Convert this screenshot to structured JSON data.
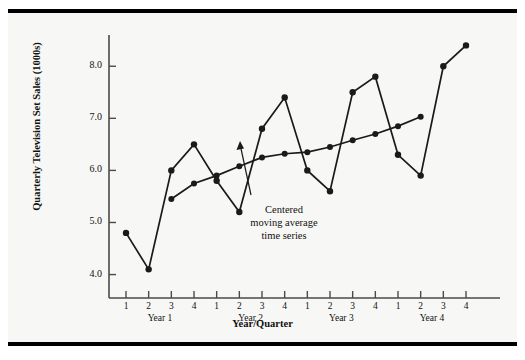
{
  "chart_data": {
    "type": "line",
    "title": "",
    "xlabel": "Year/Quarter",
    "ylabel": "Quarterly Television Set Sales (1000s)",
    "ylim": [
      3.55,
      8.6
    ],
    "yticks": [
      4.0,
      5.0,
      6.0,
      7.0,
      8.0
    ],
    "ytick_labels": [
      "4.0",
      "5.0",
      "6.0",
      "7.0",
      "8.0"
    ],
    "grid": false,
    "legend": "none",
    "categories": [
      "1",
      "2",
      "3",
      "4",
      "1",
      "2",
      "3",
      "4",
      "1",
      "2",
      "3",
      "4",
      "1",
      "2",
      "3",
      "4"
    ],
    "group_labels": [
      "Year 1",
      "Year 2",
      "Year 3",
      "Year 4"
    ],
    "series": [
      {
        "name": "Quarterly television set sales",
        "x": [
          1,
          2,
          3,
          4,
          5,
          6,
          7,
          8,
          9,
          10,
          11,
          12,
          13,
          14,
          15,
          16
        ],
        "values": [
          4.8,
          4.1,
          6.0,
          6.5,
          5.8,
          5.2,
          6.8,
          7.4,
          6.0,
          5.6,
          7.5,
          7.8,
          6.3,
          5.9,
          8.0,
          8.4
        ]
      },
      {
        "name": "Centered moving average time series",
        "x": [
          3,
          4,
          5,
          6,
          7,
          8,
          9,
          10,
          11,
          12,
          13,
          14
        ],
        "values": [
          5.45,
          5.75,
          5.9,
          6.08,
          6.25,
          6.32,
          6.35,
          6.45,
          6.58,
          6.7,
          6.85,
          7.03
        ]
      }
    ],
    "annotations": [
      {
        "text": "Centered\nmoving average\ntime series",
        "lines": [
          "Centered",
          "moving average",
          "time series"
        ],
        "points_to_series": "Centered moving average time series"
      }
    ],
    "colors": {
      "line": "#1a1a1a",
      "marker": "#1a1a1a",
      "axis": "#4a4a4a",
      "background": "#f7f7f5",
      "frame": "#000000"
    }
  },
  "annotation": {
    "line1": "Centered",
    "line2": "moving average",
    "line3": "time series"
  },
  "axes": {
    "y_title": "Quarterly Television Set Sales (1000s)",
    "x_title": "Year/Quarter",
    "y_tick_0": "4.0",
    "y_tick_1": "5.0",
    "y_tick_2": "6.0",
    "y_tick_3": "7.0",
    "y_tick_4": "8.0",
    "years": {
      "y0": "Year 1",
      "y1": "Year 2",
      "y2": "Year 3",
      "y3": "Year 4"
    },
    "quarters": [
      "1",
      "2",
      "3",
      "4",
      "1",
      "2",
      "3",
      "4",
      "1",
      "2",
      "3",
      "4",
      "1",
      "2",
      "3",
      "4"
    ]
  }
}
